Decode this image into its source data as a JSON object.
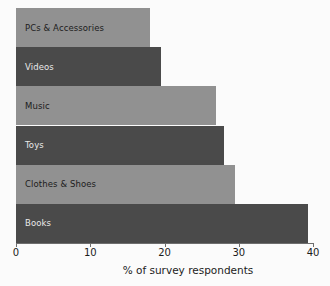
{
  "chart_data": {
    "type": "bar",
    "orientation": "horizontal",
    "title": "",
    "xlabel": "% of survey respondents",
    "ylabel": "",
    "xlim": [
      0,
      40
    ],
    "xticks": [
      0,
      10,
      20,
      30,
      40
    ],
    "xtick_labels": [
      "0",
      "10",
      "20",
      "30",
      "40"
    ],
    "grid": false,
    "legend": null,
    "categories": [
      "PCs & Accessories",
      "Videos",
      "Music",
      "Toys",
      "Clothes & Shoes",
      "Books"
    ],
    "values": [
      18,
      19.5,
      27,
      28,
      29.5,
      39.3
    ],
    "bars": [
      {
        "label": "PCs & Accessories",
        "value": 18,
        "color": "#919191",
        "shade": "light"
      },
      {
        "label": "Videos",
        "value": 19.5,
        "color": "#4a4a4a",
        "shade": "dark"
      },
      {
        "label": "Music",
        "value": 27,
        "color": "#919191",
        "shade": "light"
      },
      {
        "label": "Toys",
        "value": 28,
        "color": "#4a4a4a",
        "shade": "dark"
      },
      {
        "label": "Clothes & Shoes",
        "value": 29.5,
        "color": "#919191",
        "shade": "light"
      },
      {
        "label": "Books",
        "value": 39.3,
        "color": "#4a4a4a",
        "shade": "dark"
      }
    ],
    "colors": {
      "light_bar": "#919191",
      "dark_bar": "#4a4a4a",
      "axis": "#6e6e6e",
      "background": "#fbfbfb",
      "text_dark": "#1c1c1c",
      "text_light": "#e9e9e9"
    }
  }
}
